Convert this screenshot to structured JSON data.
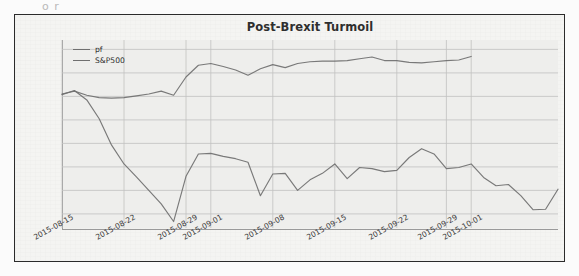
{
  "figure": {
    "scan_artifact_text": "o r",
    "title": "Post-Brexit Turmoil"
  },
  "legend": {
    "position": "upper-left",
    "entries": [
      {
        "label": "pf",
        "color": "#6f6f6f"
      },
      {
        "label": "S&P500",
        "color": "#6f6f6f"
      }
    ]
  },
  "axis": {
    "yticks": [
      "0.04",
      "0.02",
      "0.00",
      "-0.02",
      "-0.04",
      "-0.06",
      "-0.08",
      "-0.10"
    ],
    "xticks": [
      "2015-08-15",
      "2015-08-22",
      "2015-08-29",
      "2015-09-01",
      "2015-09-08",
      "2015-09-15",
      "2015-09-22",
      "2015-09-29",
      "2015-10-01"
    ]
  },
  "chart_data": {
    "type": "line",
    "title": "Post-Brexit Turmoil",
    "xlabel": "",
    "ylabel": "",
    "ylim": [
      -0.112,
      0.048
    ],
    "xlim": [
      0,
      33
    ],
    "grid": true,
    "legend_position": "upper left",
    "xtick_labels": [
      "2015-08-15",
      "2015-08-22",
      "2015-08-29",
      "2015-09-01",
      "2015-09-08",
      "2015-09-15",
      "2015-09-22",
      "2015-09-29",
      "2015-10-01"
    ],
    "xtick_positions": [
      0,
      5,
      10,
      12,
      17,
      22,
      27,
      31,
      33
    ],
    "ytick_values": [
      0.04,
      0.02,
      0.0,
      -0.02,
      -0.04,
      -0.06,
      -0.08,
      -0.1
    ],
    "x": [
      0,
      1,
      2,
      3,
      4,
      5,
      6,
      7,
      8,
      9,
      10,
      11,
      12,
      13,
      14,
      15,
      16,
      17,
      18,
      19,
      20,
      21,
      22,
      23,
      24,
      25,
      26,
      27,
      28,
      29,
      30,
      31,
      32,
      33
    ],
    "series": [
      {
        "name": "pf",
        "color": "#6f6f6f",
        "values": [
          0.002,
          0.0045,
          0.001,
          -0.001,
          -0.0015,
          -0.001,
          0.0005,
          0.002,
          0.0045,
          0.001,
          0.0165,
          0.0265,
          0.028,
          0.0255,
          0.0225,
          0.018,
          0.0235,
          0.027,
          0.0245,
          0.028,
          0.0295,
          0.03,
          0.03,
          0.0305,
          0.032,
          0.0335,
          0.0305,
          0.0305,
          0.029,
          0.0285,
          0.0295,
          0.0305,
          0.031,
          0.034
        ]
      },
      {
        "name": "S&P500",
        "color": "#6f6f6f",
        "values": [
          0.0015,
          0.005,
          -0.003,
          -0.019,
          -0.0415,
          -0.0575,
          -0.0685,
          -0.08,
          -0.0915,
          -0.1065,
          -0.068,
          -0.049,
          -0.0485,
          -0.051,
          -0.053,
          -0.056,
          -0.0845,
          -0.066,
          -0.0655,
          -0.08,
          -0.071,
          -0.0655,
          -0.0575,
          -0.07,
          -0.0605,
          -0.0615,
          -0.064,
          -0.063,
          -0.052,
          -0.0445,
          -0.049,
          -0.0615,
          -0.0605,
          -0.0575
        ]
      }
    ],
    "series2_tail": {
      "name": "S&P500-continued",
      "x": [
        33,
        34,
        35,
        36,
        37,
        38,
        39,
        40
      ],
      "values": [
        -0.0575,
        -0.069,
        -0.076,
        -0.075,
        -0.0845,
        -0.0965,
        -0.096,
        -0.079
      ]
    }
  }
}
